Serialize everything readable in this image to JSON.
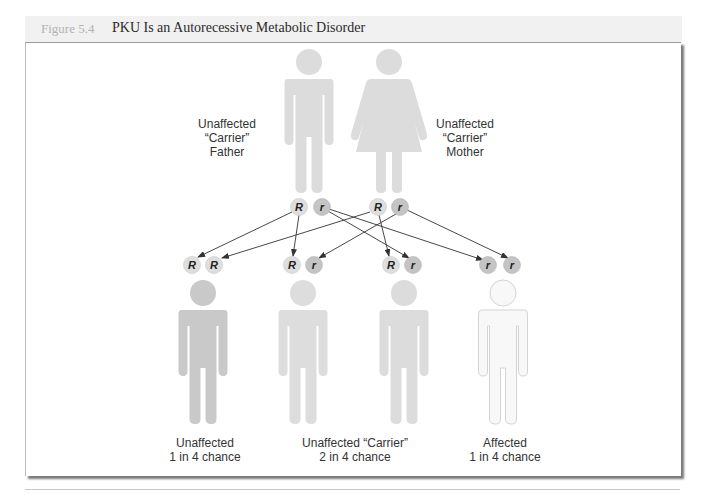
{
  "figure": {
    "number_label": "Figure 5.4",
    "title": "PKU Is an Autorecessive Metabolic Disorder"
  },
  "parents": [
    {
      "id": "father",
      "label_lines": [
        "Unaffected",
        "“Carrier”",
        "Father"
      ],
      "alleles": [
        "R",
        "r"
      ]
    },
    {
      "id": "mother",
      "label_lines": [
        "Unaffected",
        "“Carrier”",
        "Mother"
      ],
      "alleles": [
        "R",
        "r"
      ]
    }
  ],
  "children": [
    {
      "genotype": [
        "R",
        "R"
      ]
    },
    {
      "genotype": [
        "R",
        "r"
      ]
    },
    {
      "genotype": [
        "R",
        "r"
      ]
    },
    {
      "genotype": [
        "r",
        "r"
      ]
    }
  ],
  "outcome_labels": [
    {
      "lines": [
        "Unaffected",
        "1 in 4 chance"
      ]
    },
    {
      "lines": [
        "Unaffected “Carrier”",
        "2 in 4 chance"
      ]
    },
    {
      "lines": [
        "Affected",
        "1 in 4 chance"
      ]
    }
  ],
  "colors": {
    "parent_fill": "#dcdcdc",
    "allele_R_fill": "#dedede",
    "allele_r_fill": "#c4c4c4",
    "child_unaffected_fill": "#c9c9c9",
    "child_carrier_fill": "#dddddd",
    "child_affected_fill": "#f7f7f7",
    "arrow": "#333333"
  }
}
